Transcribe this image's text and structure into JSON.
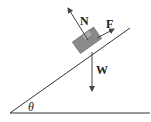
{
  "diagram": {
    "labels": {
      "normal": "N",
      "force": "F",
      "weight": "W",
      "angle": "θ"
    },
    "colors": {
      "line": "#333333",
      "block_fill": "#8a8a8a",
      "block_stroke": "#555555"
    }
  }
}
